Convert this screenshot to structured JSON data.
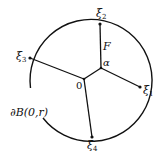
{
  "diagram": {
    "type": "geometry-figure",
    "stroke_color": "#111111",
    "background": "#ffffff",
    "circle": {
      "cx": 92,
      "cy": 82,
      "r": 61,
      "label": "∂B(0,r)"
    },
    "nodes": {
      "origin": {
        "x": 84,
        "y": 79,
        "label": "0"
      },
      "alpha": {
        "x": 101,
        "y": 68,
        "label": "α"
      },
      "xi1": {
        "x": 140,
        "y": 87,
        "label": "ξ",
        "sub": "1"
      },
      "xi2": {
        "x": 100,
        "y": 24,
        "label": "ξ",
        "sub": "2"
      },
      "xi3": {
        "x": 30,
        "y": 58,
        "label": "ξ",
        "sub": "3"
      },
      "xi4": {
        "x": 92,
        "y": 137,
        "label": "ξ",
        "sub": "4"
      }
    },
    "edges": [
      {
        "from": "origin",
        "to": "alpha"
      },
      {
        "from": "alpha",
        "to": "xi2",
        "label": "F"
      },
      {
        "from": "alpha",
        "to": "xi1"
      },
      {
        "from": "origin",
        "to": "xi3"
      },
      {
        "from": "origin",
        "to": "xi4"
      }
    ],
    "edge_label_F": "F",
    "boundary_label": "∂B(0,r)"
  }
}
